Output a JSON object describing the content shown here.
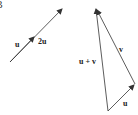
{
  "corner_label": "B",
  "left_figure": {
    "label_u": "u",
    "label_2u": "2u"
  },
  "right_figure": {
    "label_sum": "u + v",
    "label_v": "v",
    "label_u": "u"
  },
  "colors": {
    "stroke": "#333333",
    "background": "#ffffff"
  }
}
